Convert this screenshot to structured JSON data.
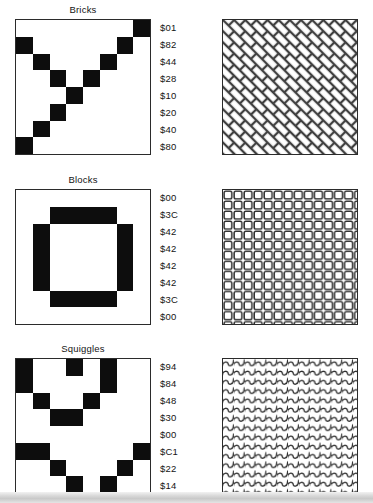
{
  "figure": {
    "background_color": "#ffffff",
    "ink_color": "#0d0d0d",
    "border_color": "#2b2b2b"
  },
  "panels": [
    {
      "title": "Bricks",
      "top": 4,
      "pattern_type": "diagonal-weave",
      "bytes": [
        "$01",
        "$82",
        "$44",
        "$28",
        "$10",
        "$20",
        "$40",
        "$80"
      ],
      "bits": [
        [
          0,
          0,
          0,
          0,
          0,
          0,
          0,
          1
        ],
        [
          1,
          0,
          0,
          0,
          0,
          0,
          1,
          0
        ],
        [
          0,
          1,
          0,
          0,
          0,
          1,
          0,
          0
        ],
        [
          0,
          0,
          1,
          0,
          1,
          0,
          0,
          0
        ],
        [
          0,
          0,
          0,
          1,
          0,
          0,
          0,
          0
        ],
        [
          0,
          0,
          1,
          0,
          0,
          0,
          0,
          0
        ],
        [
          0,
          1,
          0,
          0,
          0,
          0,
          0,
          0
        ],
        [
          1,
          0,
          0,
          0,
          0,
          0,
          0,
          0
        ]
      ]
    },
    {
      "title": "Blocks",
      "top": 174,
      "pattern_type": "square-grid",
      "bytes": [
        "$00",
        "$3C",
        "$42",
        "$42",
        "$42",
        "$42",
        "$3C",
        "$00"
      ],
      "bits": [
        [
          0,
          0,
          0,
          0,
          0,
          0,
          0,
          0
        ],
        [
          0,
          0,
          1,
          1,
          1,
          1,
          0,
          0
        ],
        [
          0,
          1,
          0,
          0,
          0,
          0,
          1,
          0
        ],
        [
          0,
          1,
          0,
          0,
          0,
          0,
          1,
          0
        ],
        [
          0,
          1,
          0,
          0,
          0,
          0,
          1,
          0
        ],
        [
          0,
          1,
          0,
          0,
          0,
          0,
          1,
          0
        ],
        [
          0,
          0,
          1,
          1,
          1,
          1,
          0,
          0
        ],
        [
          0,
          0,
          0,
          0,
          0,
          0,
          0,
          0
        ]
      ]
    },
    {
      "title": "Squiggles",
      "top": 343,
      "pattern_type": "squiggle-waves",
      "bytes": [
        "$94",
        "$84",
        "$48",
        "$30",
        "$00",
        "$C1",
        "$22",
        "$14"
      ],
      "bits": [
        [
          1,
          0,
          0,
          1,
          0,
          1,
          0,
          0
        ],
        [
          1,
          0,
          0,
          0,
          0,
          1,
          0,
          0
        ],
        [
          0,
          1,
          0,
          0,
          1,
          0,
          0,
          0
        ],
        [
          0,
          0,
          1,
          1,
          0,
          0,
          0,
          0
        ],
        [
          0,
          0,
          0,
          0,
          0,
          0,
          0,
          0
        ],
        [
          1,
          1,
          0,
          0,
          0,
          0,
          0,
          1
        ],
        [
          0,
          0,
          1,
          0,
          0,
          0,
          1,
          0
        ],
        [
          0,
          0,
          0,
          1,
          0,
          1,
          0,
          0
        ]
      ]
    }
  ],
  "bottom_band": {
    "caption": ""
  }
}
